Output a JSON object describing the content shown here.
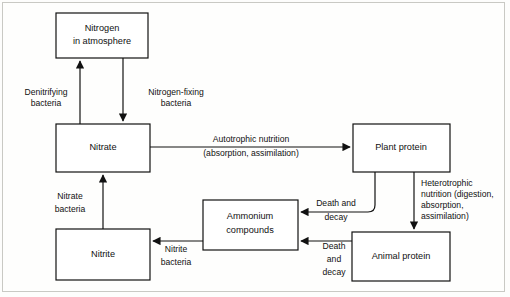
{
  "diagram": {
    "type": "flow-diagram",
    "colors": {
      "background": "#fdfdfc",
      "box_fill": "#ffffff",
      "stroke": "#111111",
      "frame": "#c9c9c4"
    },
    "nodes": [
      {
        "id": "nitrogen-atmosphere",
        "lines": [
          "Nitrogen",
          "in atmosphere"
        ],
        "x": 56,
        "y": 13,
        "w": 92,
        "h": 45
      },
      {
        "id": "nitrate",
        "lines": [
          "Nitrate"
        ],
        "x": 56,
        "y": 124,
        "w": 94,
        "h": 48
      },
      {
        "id": "nitrite",
        "lines": [
          "Nitrite"
        ],
        "x": 56,
        "y": 229,
        "w": 94,
        "h": 51
      },
      {
        "id": "ammonium-compounds",
        "lines": [
          "Ammonium",
          "compounds"
        ],
        "x": 203,
        "y": 200,
        "w": 95,
        "h": 50
      },
      {
        "id": "plant-protein",
        "lines": [
          "Plant protein"
        ],
        "x": 353,
        "y": 124,
        "w": 97,
        "h": 48
      },
      {
        "id": "animal-protein",
        "lines": [
          "Animal protein"
        ],
        "x": 352,
        "y": 232,
        "w": 98,
        "h": 49
      }
    ],
    "edges": [
      {
        "id": "denitrifying",
        "from": "nitrate",
        "to": "nitrogen-atmosphere",
        "label_lines": [
          "Denitrifying",
          "bacteria"
        ],
        "label_x": 46,
        "label_y": 92
      },
      {
        "id": "nitrogen-fixing",
        "from": "nitrogen-atmosphere",
        "to": "nitrate",
        "label_lines": [
          "Nitrogen-fixing",
          "bacteria"
        ],
        "label_x": 175,
        "label_y": 92
      },
      {
        "id": "autotrophic-nutrition",
        "from": "nitrate",
        "to": "plant-protein",
        "label_lines": [
          "Autotrophic nutrition",
          "(absorption, assimilation)"
        ],
        "label_x": 252,
        "label_y": 141
      },
      {
        "id": "heterotrophic-nutrition",
        "from": "plant-protein",
        "to": "animal-protein",
        "label_lines": [
          "Heterotrophic",
          "nutrition (digestion,",
          "absorption,",
          "assimilation)"
        ],
        "label_x": 419,
        "label_y": 186
      },
      {
        "id": "plant-death-decay",
        "from": "plant-protein",
        "to": "ammonium-compounds",
        "label_lines": [
          "Death and",
          "decay"
        ],
        "label_x": 337,
        "label_y": 203
      },
      {
        "id": "animal-death-decay",
        "from": "animal-protein",
        "to": "ammonium-compounds",
        "label_lines": [
          "Death",
          "and",
          "decay"
        ],
        "label_x": 335,
        "label_y": 244
      },
      {
        "id": "nitrite-bacteria",
        "from": "ammonium-compounds",
        "to": "nitrite",
        "label_lines": [
          "Nitrite",
          "bacteria"
        ],
        "label_x": 175,
        "label_y": 248
      },
      {
        "id": "nitrate-bacteria",
        "from": "nitrite",
        "to": "nitrate",
        "label_lines": [
          "Nitrate",
          "bacteria"
        ],
        "label_x": 68,
        "label_y": 196
      }
    ]
  }
}
